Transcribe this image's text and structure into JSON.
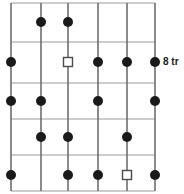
{
  "figure": {
    "title": "",
    "background_color": "#ffffff",
    "width": 184,
    "height": 194
  },
  "annotations": [
    {
      "name": "row-label-8tr",
      "text": "8 tr",
      "x": 163,
      "y": 57,
      "color": "#1a1a1a"
    }
  ],
  "chart_data": {
    "type": "scatter",
    "title": "",
    "xlabel": "",
    "ylabel": "",
    "grid": true,
    "legend_position": "none",
    "xlim": [
      0,
      184
    ],
    "ylim": [
      0,
      194
    ],
    "grid_lines": {
      "vertical_color": "#6e6e6e",
      "vertical_width": 1.6,
      "vertical_x": [
        11,
        41,
        68,
        98,
        127,
        155
      ],
      "horizontal_color": "#9a9a9a",
      "horizontal_width": 1.2,
      "horizontal_y": [
        3,
        42,
        83,
        119,
        155,
        191
      ]
    },
    "columns": [
      11,
      41,
      68,
      98,
      127,
      155
    ],
    "rows": [
      22,
      62,
      101,
      137,
      175
    ],
    "markers": {
      "filled_circle": {
        "shape": "circle",
        "fill": "#1a1a1a",
        "stroke": "none",
        "radius": 5
      },
      "open_square": {
        "shape": "square",
        "fill": "#ffffff",
        "stroke": "#4a4a4a",
        "stroke_width": 1.4,
        "size": 9
      }
    },
    "series": [
      {
        "name": "filled-circle-points",
        "marker": "filled_circle",
        "points": [
          {
            "x": 41,
            "y": 22
          },
          {
            "x": 68,
            "y": 22
          },
          {
            "x": 11,
            "y": 62
          },
          {
            "x": 98,
            "y": 62
          },
          {
            "x": 127,
            "y": 62
          },
          {
            "x": 155,
            "y": 62
          },
          {
            "x": 11,
            "y": 101
          },
          {
            "x": 41,
            "y": 101
          },
          {
            "x": 98,
            "y": 101
          },
          {
            "x": 155,
            "y": 101
          },
          {
            "x": 41,
            "y": 137
          },
          {
            "x": 68,
            "y": 137
          },
          {
            "x": 127,
            "y": 137
          },
          {
            "x": 11,
            "y": 175
          },
          {
            "x": 68,
            "y": 175
          },
          {
            "x": 98,
            "y": 175
          },
          {
            "x": 155,
            "y": 175
          }
        ]
      },
      {
        "name": "open-square-points",
        "marker": "open_square",
        "points": [
          {
            "x": 68,
            "y": 62
          },
          {
            "x": 127,
            "y": 175
          }
        ]
      }
    ]
  }
}
